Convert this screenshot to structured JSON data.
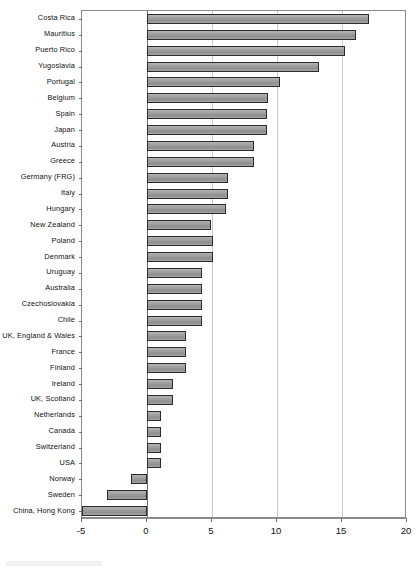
{
  "chart_data": {
    "type": "bar",
    "orientation": "horizontal",
    "title": "",
    "subtitle": "",
    "xlabel": "",
    "ylabel": "",
    "xlim": [
      -5,
      20
    ],
    "ylim": null,
    "grid": true,
    "gridlines_x": [
      5,
      10,
      15
    ],
    "zero_line": 0,
    "legend": null,
    "legend_position": "none",
    "xticks": [
      -5,
      0,
      5,
      10,
      15,
      20
    ],
    "xtick_labels": [
      "-5",
      "0",
      "5",
      "10",
      "15",
      "20"
    ],
    "categories": [
      "Costa Rica",
      "Mauritius",
      "Puerto Rico",
      "Yugoslavia",
      "Portugal",
      "Belgium",
      "Spain",
      "Japan",
      "Austria",
      "Greece",
      "Germany (FRG)",
      "Italy",
      "Hungary",
      "New Zealand",
      "Poland",
      "Denmark",
      "Uruguay",
      "Australia",
      "Czechoslovakia",
      "Chile",
      "UK, England & Wales",
      "France",
      "Finland",
      "Ireland",
      "UK, Scotland",
      "Netherlands",
      "Canada",
      "Switzerland",
      "USA",
      "Norway",
      "Sweden",
      "China, Hong Kong"
    ],
    "values": [
      17.1,
      16.1,
      15.2,
      13.2,
      10.2,
      9.3,
      9.2,
      9.2,
      8.2,
      8.2,
      6.2,
      6.2,
      6.1,
      4.9,
      5.1,
      5.1,
      4.2,
      4.2,
      4.2,
      4.2,
      3.0,
      3.0,
      3.0,
      2.0,
      2.0,
      1.1,
      1.1,
      1.1,
      1.1,
      -1.2,
      -3.1,
      -5.0
    ]
  },
  "style": {
    "bar_fill": "#9a9a9a",
    "bar_border": "#2b2b2b",
    "gridline_color": "#c9c9c9",
    "axis_color": "#8a8a8a",
    "text_color": "#111111",
    "background": "#ffffff"
  }
}
